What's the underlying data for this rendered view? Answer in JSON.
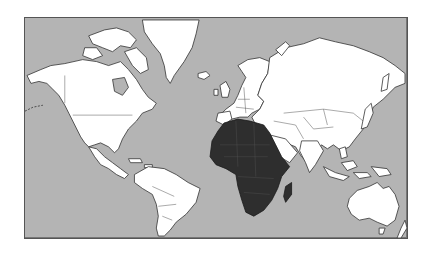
{
  "map": {
    "projection": "mercator-world",
    "highlighted_region": "Africa",
    "colors": {
      "ocean": "#b4b4b4",
      "land": "#ffffff",
      "highlight": "#2e2e2e",
      "outline": "#333333",
      "frame": "#555555",
      "page_background": "#ffffff"
    },
    "regions": [
      {
        "id": "north-america",
        "name": "North America",
        "highlighted": false
      },
      {
        "id": "greenland",
        "name": "Greenland",
        "highlighted": false
      },
      {
        "id": "south-america",
        "name": "South America",
        "highlighted": false
      },
      {
        "id": "europe",
        "name": "Europe",
        "highlighted": false
      },
      {
        "id": "asia",
        "name": "Asia",
        "highlighted": false
      },
      {
        "id": "africa",
        "name": "Africa",
        "highlighted": true
      },
      {
        "id": "madagascar",
        "name": "Madagascar",
        "highlighted": true
      },
      {
        "id": "australia",
        "name": "Australia",
        "highlighted": false
      },
      {
        "id": "new-zealand",
        "name": "New Zealand",
        "highlighted": false
      },
      {
        "id": "indonesia",
        "name": "Indonesia",
        "highlighted": false
      },
      {
        "id": "japan",
        "name": "Japan",
        "highlighted": false
      }
    ]
  }
}
